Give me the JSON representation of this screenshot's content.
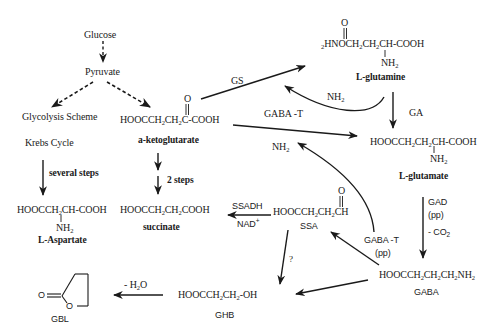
{
  "diagram": {
    "nodes": {
      "glucose": "Glucose",
      "pyruvate": "Pyruvate",
      "glycolysis": "Glycolysis Scheme",
      "krebs": "Krebs Cycle",
      "several_steps": "several steps",
      "aspartate_formula_main": "HOOCCH",
      "aspartate_formula_tail": "CH-COOH",
      "aspartate_nh2": "NH",
      "aspartate_name": "L-Aspartate",
      "akg_o": "O",
      "akg_formula_a": "HOOCCH",
      "akg_formula_b": "CH",
      "akg_formula_c": "C-COOH",
      "akg_name": "a-ketoglutarate",
      "two_steps": "2 steps",
      "succinate_formula_a": "HOOCCH",
      "succinate_formula_b": "CH",
      "succinate_formula_c": "COOH",
      "succinate_name": "succinate",
      "glutamine_o": "O",
      "glutamine_prefix": "2",
      "glutamine_formula_a": "HNOCH",
      "glutamine_formula_b": "CH",
      "glutamine_formula_c": "CH-COOH",
      "glutamine_nh2": "NH",
      "glutamine_name": "L-glutamine",
      "glutamate_formula_a": "HOOCCH",
      "glutamate_formula_b": "CH",
      "glutamate_formula_c": "CH-COOH",
      "glutamate_nh2": "NH",
      "glutamate_name": "L-glutamate",
      "ssa_o": "O",
      "ssa_formula_a": "HOOCCH",
      "ssa_formula_b": "CH",
      "ssa_formula_c": "CH",
      "ssa_name": "SSA",
      "gaba_formula_a": "HOOCCH",
      "gaba_formula_b": "CH",
      "gaba_formula_c": "CH",
      "gaba_formula_d": "NH",
      "gaba_name": "GABA",
      "ghb_formula_a": "HOOCCH",
      "ghb_formula_b": "CH",
      "ghb_formula_c": "-OH",
      "ghb_name": "GHB",
      "gbl_o_carbonyl": "O",
      "gbl_o_ring": "O",
      "gbl_name": "GBL"
    },
    "enzymes": {
      "gs": "GS",
      "gaba_t_top": "GABA -T",
      "nh2_top": "NH",
      "ga": "GA",
      "nh2_mid": "NH",
      "ssadh": "SSADH",
      "nad": "NAD",
      "nad_charge": "+",
      "gad": "GAD",
      "gad_pp": "(pp)",
      "co2": "- CO",
      "gaba_t_bottom": "GABA -T",
      "gaba_t_bottom_pp": "(pp)",
      "question": "?",
      "water": "- H",
      "water_tail": "O"
    },
    "subscripts": {
      "two": "2"
    },
    "colors": {
      "ink": "#1a1a1a",
      "background": "#ffffff"
    }
  }
}
